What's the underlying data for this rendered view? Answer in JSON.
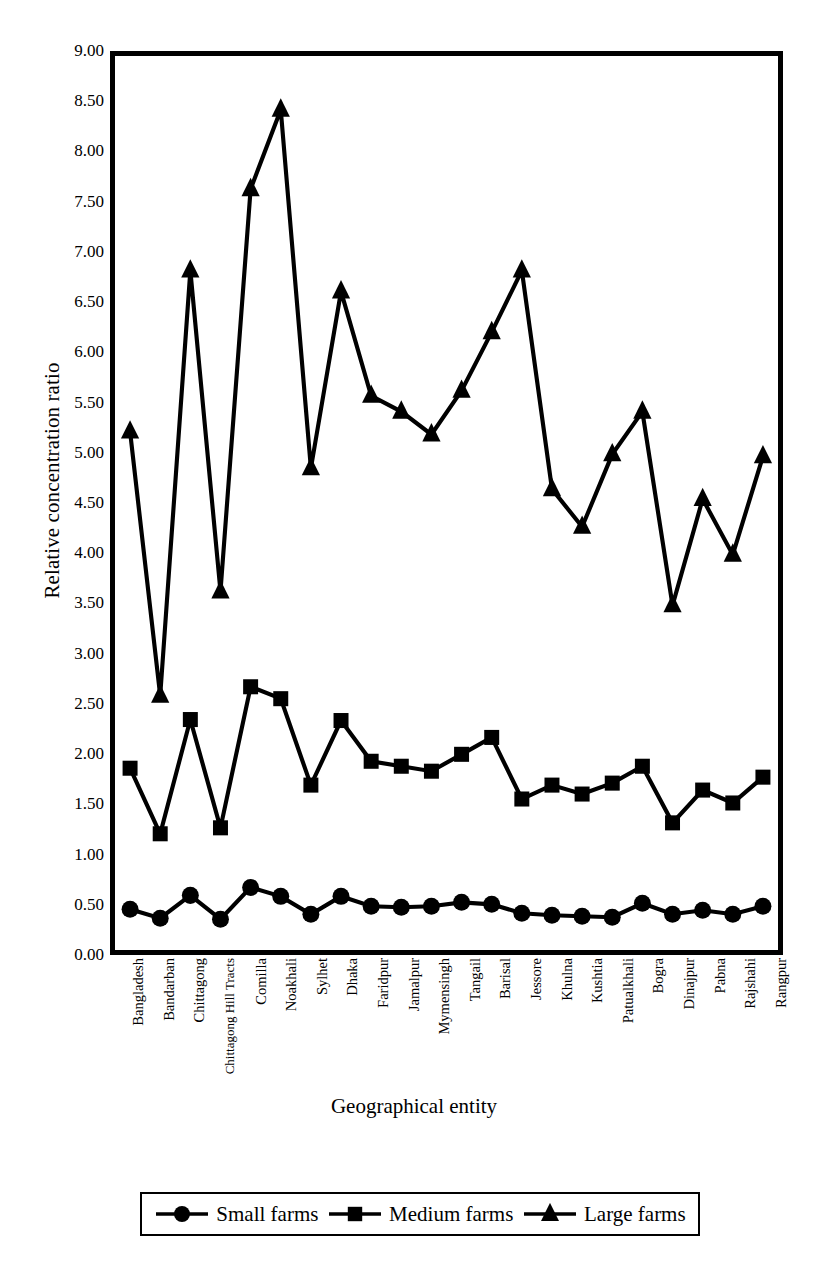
{
  "chart_data": {
    "type": "line",
    "title": "",
    "xlabel": "Geographical entity",
    "ylabel": "Relative concentration ratio",
    "ylim": [
      0.0,
      9.0
    ],
    "ytick_step": 0.5,
    "grid": false,
    "legend_position": "bottom",
    "yticks": [
      "9.00",
      "8.50",
      "8.00",
      "7.50",
      "7.00",
      "6.50",
      "6.00",
      "5.50",
      "5.00",
      "4.50",
      "4.00",
      "3.50",
      "3.00",
      "2.50",
      "2.00",
      "1.50",
      "1.00",
      "0.50",
      "0.00"
    ],
    "categories": [
      "Bangladesh",
      "Bandarban",
      "Chittagong",
      "Chittagong Hill Tracts",
      "Comilla",
      "Noakhali",
      "Sylhet",
      "Dhaka",
      "Faridpur",
      "Jamalpur",
      "Mymensingh",
      "Tangail",
      "Barisal",
      "Jessore",
      "Khulna",
      "Kushtia",
      "Patualkhali",
      "Bogra",
      "Dinajpur",
      "Pabna",
      "Rajshahi",
      "Rangpur"
    ],
    "series": [
      {
        "name": "Small farms",
        "marker": "circle",
        "color": "#000000",
        "values": [
          0.41,
          0.32,
          0.55,
          0.31,
          0.63,
          0.54,
          0.36,
          0.54,
          0.44,
          0.43,
          0.44,
          0.48,
          0.46,
          0.37,
          0.35,
          0.34,
          0.33,
          0.47,
          0.36,
          0.4,
          0.36,
          0.44
        ]
      },
      {
        "name": "Medium farms",
        "marker": "square",
        "color": "#000000",
        "values": [
          1.83,
          1.17,
          2.32,
          1.23,
          2.65,
          2.53,
          1.66,
          2.31,
          1.9,
          1.85,
          1.8,
          1.97,
          2.14,
          1.52,
          1.66,
          1.57,
          1.68,
          1.85,
          1.28,
          1.61,
          1.48,
          1.74
        ]
      },
      {
        "name": "Large farms",
        "marker": "triangle",
        "color": "#000000",
        "values": [
          5.22,
          2.56,
          6.84,
          3.61,
          7.66,
          8.46,
          4.85,
          6.63,
          5.58,
          5.42,
          5.19,
          5.63,
          6.22,
          6.84,
          4.64,
          4.26,
          4.99,
          5.42,
          3.47,
          4.54,
          3.98,
          4.97
        ]
      }
    ]
  },
  "legend": {
    "items": [
      {
        "label": "Small farms",
        "icon": "circle-marker-icon"
      },
      {
        "label": "Medium farms",
        "icon": "square-marker-icon"
      },
      {
        "label": "Large farms",
        "icon": "triangle-marker-icon"
      }
    ]
  }
}
